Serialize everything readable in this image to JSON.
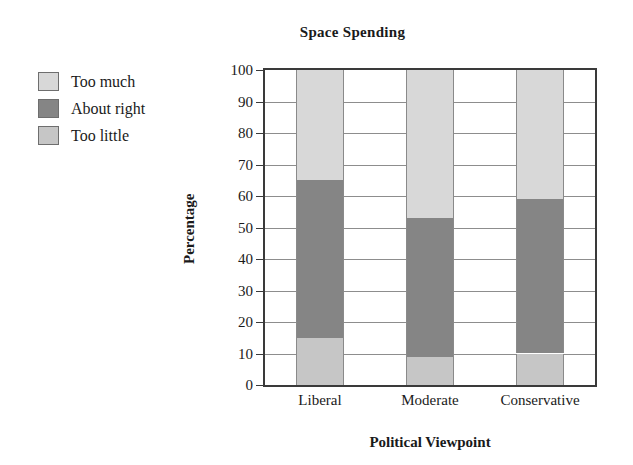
{
  "chart_data": {
    "type": "bar",
    "subtype": "stacked-bar-100",
    "title": "Space Spending",
    "xlabel": "Political Viewpoint",
    "ylabel": "Percentage",
    "categories": [
      "Liberal",
      "Moderate",
      "Conservative"
    ],
    "series": [
      {
        "name": "Too little",
        "color": "#c6c6c6",
        "values": [
          15,
          9,
          10
        ]
      },
      {
        "name": "About right",
        "color": "#858585",
        "values": [
          50,
          44,
          49
        ]
      },
      {
        "name": "Too much",
        "color": "#d8d8d8",
        "values": [
          35,
          47,
          41
        ]
      }
    ],
    "cumulative_tops": {
      "Liberal": {
        "too_little": 15,
        "about_right": 65,
        "too_much": 100
      },
      "Moderate": {
        "too_little": 9,
        "about_right": 53,
        "too_much": 100
      },
      "Conservative": {
        "too_little": 10,
        "about_right": 59,
        "too_much": 100
      }
    },
    "ylim": [
      0,
      100
    ],
    "yticks": [
      0,
      10,
      20,
      30,
      40,
      50,
      60,
      70,
      80,
      90,
      100
    ],
    "ytick_labels": [
      "0",
      "10",
      "20",
      "30",
      "40",
      "50",
      "60",
      "70",
      "80",
      "90",
      "100"
    ],
    "grid": "horizontal",
    "legend_position": "upper-left-outside",
    "legend_order": [
      "Too much",
      "About right",
      "Too little"
    ]
  },
  "legend": {
    "entries": [
      {
        "label": "Too much",
        "color": "#d8d8d8"
      },
      {
        "label": "About right",
        "color": "#858585"
      },
      {
        "label": "Too little",
        "color": "#c6c6c6"
      }
    ]
  },
  "axes": {
    "y_title": "Percentage",
    "x_title": "Political Viewpoint"
  }
}
